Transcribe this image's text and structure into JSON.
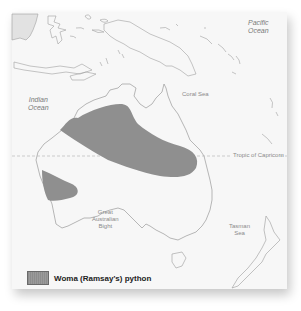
{
  "map": {
    "region": "Australia and surrounding region",
    "labels": {
      "pacific_ocean": "Pacific\nOcean",
      "indian_ocean": "Indian\nOcean",
      "coral_sea": "Coral Sea",
      "great_australian_bight": "Great\nAustralian\nBight",
      "tasman_sea": "Tasman\nSea",
      "tropic": "Tropic of Capricorn"
    },
    "colors": {
      "background": "#f7f7f7",
      "coastline": "#9a9a9a",
      "range_fill": "#8f8f8f",
      "landmass_fill": "#e2e2e2"
    }
  },
  "legend": {
    "items": [
      {
        "label": "Woma (Ramsay's) python",
        "color": "#8f8f8f"
      }
    ]
  }
}
